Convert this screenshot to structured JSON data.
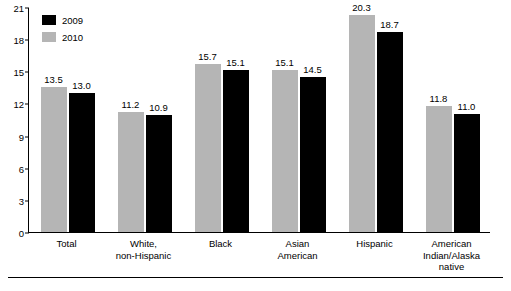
{
  "chart_data": {
    "type": "bar",
    "title": "",
    "subtitle": "",
    "xlabel": "",
    "ylabel": "",
    "ylim": [
      0,
      21
    ],
    "yticks": [
      0,
      3,
      6,
      9,
      12,
      15,
      18,
      21
    ],
    "ytick_labels": [
      "0",
      "3",
      "6",
      "9",
      "12",
      "15",
      "18",
      "21"
    ],
    "grid": false,
    "legend_position": "top-left",
    "categories": [
      "Total",
      "White,\nnon-Hispanic",
      "Black",
      "Asian\nAmerican",
      "Hispanic",
      "American\nIndian/Alaska\nnative"
    ],
    "category_lines": [
      [
        "Total"
      ],
      [
        "White,",
        "non-Hispanic"
      ],
      [
        "Black"
      ],
      [
        "Asian",
        "American"
      ],
      [
        "Hispanic"
      ],
      [
        "American",
        "Indian/Alaska",
        "native"
      ]
    ],
    "series": [
      {
        "name": "2009",
        "color": "#000000",
        "values": [
          13.0,
          10.9,
          15.1,
          14.5,
          18.7,
          11.0
        ],
        "value_labels": [
          "13.0",
          "10.9",
          "15.1",
          "14.5",
          "18.7",
          "11.0"
        ]
      },
      {
        "name": "2010",
        "color": "#b5b5b5",
        "values": [
          13.5,
          11.2,
          15.7,
          15.1,
          20.3,
          11.8
        ],
        "value_labels": [
          "13.5",
          "11.2",
          "15.7",
          "15.1",
          "20.3",
          "11.8"
        ]
      }
    ],
    "bar_order_in_group": [
      "2010",
      "2009"
    ],
    "legend": [
      {
        "label": "2009",
        "color": "#000000"
      },
      {
        "label": "2010",
        "color": "#b5b5b5"
      }
    ]
  }
}
